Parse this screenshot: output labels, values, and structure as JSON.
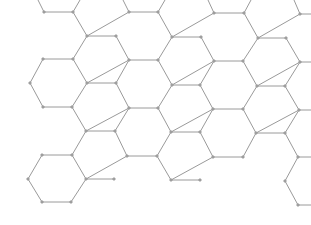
{
  "diagram": {
    "type": "hexagonal-lattice",
    "colors": {
      "background": "#ffffff",
      "bond": "#9a9a9a",
      "atom": "#a8a8a8"
    },
    "atom_radius": 1.3,
    "nodes": {
      "a1": [
        44,
        12
      ],
      "a2": [
        73,
        12
      ],
      "a3": [
        129,
        12
      ],
      "a4": [
        158,
        12
      ],
      "a5": [
        214,
        13
      ],
      "a6": [
        244,
        13
      ],
      "a7": [
        300,
        14
      ],
      "b1": [
        87,
        36
      ],
      "b2": [
        116,
        36
      ],
      "b3": [
        172,
        37
      ],
      "b4": [
        201,
        37
      ],
      "b5": [
        258,
        38
      ],
      "b6": [
        286,
        38
      ],
      "c1": [
        43,
        59
      ],
      "c2": [
        73,
        59
      ],
      "c3": [
        129,
        60
      ],
      "c4": [
        158,
        60
      ],
      "c5": [
        214,
        61
      ],
      "c6": [
        243,
        61
      ],
      "c7": [
        300,
        62
      ],
      "d0": [
        30,
        83
      ],
      "d1": [
        87,
        83
      ],
      "d2": [
        116,
        83
      ],
      "d3": [
        172,
        85
      ],
      "d4": [
        200,
        85
      ],
      "d5": [
        257,
        86
      ],
      "d6": [
        285,
        86
      ],
      "e1": [
        43,
        107
      ],
      "e2": [
        72,
        107
      ],
      "e3": [
        129,
        108
      ],
      "e4": [
        158,
        108
      ],
      "e5": [
        213,
        109
      ],
      "e6": [
        243,
        109
      ],
      "e7": [
        299,
        110
      ],
      "f1": [
        86,
        131
      ],
      "f2": [
        115,
        131
      ],
      "f3": [
        171,
        132
      ],
      "f4": [
        200,
        132
      ],
      "f5": [
        256,
        133
      ],
      "f6": [
        285,
        133
      ],
      "g1": [
        42,
        155
      ],
      "g2": [
        72,
        155
      ],
      "g3": [
        127,
        156
      ],
      "g4": [
        157,
        156
      ],
      "g5": [
        213,
        157
      ],
      "g6": [
        243,
        157
      ],
      "g7": [
        298,
        157
      ],
      "h0": [
        28,
        179
      ],
      "h1": [
        86,
        179
      ],
      "h2": [
        114,
        179
      ],
      "h3": [
        171,
        180
      ],
      "h4": [
        200,
        180
      ],
      "h6": [
        285,
        181
      ],
      "i1": [
        42,
        202
      ],
      "i2": [
        71,
        202
      ],
      "i7": [
        298,
        205
      ]
    },
    "open_ends": [
      [
        "a1",
        [
          38,
          0
        ]
      ],
      [
        "a2",
        [
          80,
          0
        ]
      ],
      [
        "a3",
        [
          123,
          0
        ]
      ],
      [
        "a4",
        [
          165,
          0
        ]
      ],
      [
        "a5",
        [
          208,
          0
        ]
      ],
      [
        "a6",
        [
          251,
          0
        ]
      ],
      [
        "a7",
        [
          294,
          0
        ]
      ],
      [
        "a7",
        [
          311,
          14
        ]
      ],
      [
        "c7",
        [
          311,
          62
        ]
      ],
      [
        "e7",
        [
          311,
          110
        ]
      ],
      [
        "g7",
        [
          311,
          157
        ]
      ],
      [
        "i7",
        [
          311,
          205
        ]
      ]
    ],
    "edges": [
      [
        "a1",
        "a2"
      ],
      [
        "a3",
        "a4"
      ],
      [
        "a5",
        "a6"
      ],
      [
        "a2",
        "b1"
      ],
      [
        "b1",
        "a3"
      ],
      [
        "a4",
        "b3"
      ],
      [
        "b3",
        "a5"
      ],
      [
        "a6",
        "b5"
      ],
      [
        "b5",
        "a7"
      ],
      [
        "b1",
        "b2"
      ],
      [
        "b3",
        "b4"
      ],
      [
        "b5",
        "b6"
      ],
      [
        "b2",
        "c3"
      ],
      [
        "b4",
        "c5"
      ],
      [
        "b6",
        "c7"
      ],
      [
        "b1",
        "c2"
      ],
      [
        "b3",
        "c4"
      ],
      [
        "b5",
        "c6"
      ],
      [
        "c1",
        "c2"
      ],
      [
        "c3",
        "c4"
      ],
      [
        "c5",
        "c6"
      ],
      [
        "c1",
        "d0"
      ],
      [
        "c2",
        "d1"
      ],
      [
        "d1",
        "c3"
      ],
      [
        "c4",
        "d3"
      ],
      [
        "d3",
        "c5"
      ],
      [
        "c6",
        "d5"
      ],
      [
        "d5",
        "c7"
      ],
      [
        "d1",
        "d2"
      ],
      [
        "d3",
        "d4"
      ],
      [
        "d5",
        "d6"
      ],
      [
        "d0",
        "e1"
      ],
      [
        "d1",
        "e2"
      ],
      [
        "d2",
        "e3"
      ],
      [
        "d3",
        "e4"
      ],
      [
        "d4",
        "e5"
      ],
      [
        "d5",
        "e6"
      ],
      [
        "d6",
        "e7"
      ],
      [
        "d2",
        "c3"
      ],
      [
        "d4",
        "c5"
      ],
      [
        "d6",
        "c7"
      ],
      [
        "e1",
        "e2"
      ],
      [
        "e3",
        "e4"
      ],
      [
        "e5",
        "e6"
      ],
      [
        "e2",
        "f1"
      ],
      [
        "f1",
        "e3"
      ],
      [
        "e4",
        "f3"
      ],
      [
        "f3",
        "e5"
      ],
      [
        "e6",
        "f5"
      ],
      [
        "f5",
        "e7"
      ],
      [
        "f1",
        "f2"
      ],
      [
        "f3",
        "f4"
      ],
      [
        "f5",
        "f6"
      ],
      [
        "f2",
        "g3"
      ],
      [
        "f4",
        "g5"
      ],
      [
        "f6",
        "g7"
      ],
      [
        "f1",
        "g2"
      ],
      [
        "f3",
        "g4"
      ],
      [
        "f5",
        "g6"
      ],
      [
        "e3",
        "f2"
      ],
      [
        "e5",
        "f4"
      ],
      [
        "e7",
        "f6"
      ],
      [
        "g1",
        "g2"
      ],
      [
        "g3",
        "g4"
      ],
      [
        "g5",
        "g6"
      ],
      [
        "g1",
        "h0"
      ],
      [
        "g2",
        "h1"
      ],
      [
        "h1",
        "g3"
      ],
      [
        "g4",
        "h3"
      ],
      [
        "h3",
        "g5"
      ],
      [
        "g7",
        "h6"
      ],
      [
        "h1",
        "h2"
      ],
      [
        "h3",
        "h4"
      ],
      [
        "h0",
        "i1"
      ],
      [
        "h1",
        "i2"
      ],
      [
        "i1",
        "i2"
      ],
      [
        "h6",
        "i7"
      ]
    ]
  }
}
